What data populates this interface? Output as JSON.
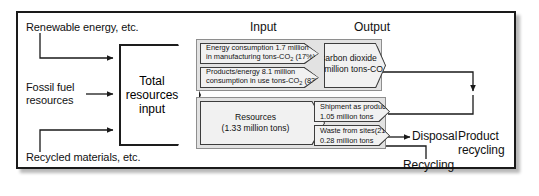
{
  "diagram": {
    "column_headers": {
      "input": "Input",
      "output": "Output"
    },
    "inputs_left": [
      {
        "id": "renewable-energy",
        "label": "Renewable energy, etc."
      },
      {
        "id": "fossil-fuel",
        "label": "Fossil fuel\nresources"
      },
      {
        "id": "recycled-materials",
        "label": "Recycled materials, etc."
      }
    ],
    "center": {
      "label": "Total\nresources\ninput"
    },
    "energy_row": {
      "input": [
        {
          "id": "energy-consumption",
          "line1": "Energy consumption 1.7 million",
          "line2_pre": "in manufacturing tons-CO",
          "line2_sub": "2",
          "line2_post": " (17%)"
        },
        {
          "id": "products-energy",
          "line1": "Products/energy 8.1 million",
          "line2_pre": "consumption in use tons-CO",
          "line2_sub": "2",
          "line2_post": " (83%)"
        }
      ],
      "output": {
        "id": "carbon-dioxide",
        "line1": "Carbon dioxide",
        "line2_pre": "(9.8 million tons-CO",
        "line2_sub": "2",
        "line2_post": ")"
      }
    },
    "materials_row": {
      "input": {
        "id": "resources",
        "line1": "Resources",
        "line2": "(1.33 million tons)"
      },
      "output": [
        {
          "id": "shipment-as-products",
          "line1": "Shipment as products  (79%)",
          "line2": "1.05 million tons"
        },
        {
          "id": "waste-from-sites",
          "line1": "Waste from sites",
          "line1_pct": "(21%)",
          "line2": "0.28 million tons"
        }
      ]
    },
    "outputs_right": [
      {
        "id": "disposal",
        "label": "Disposal"
      },
      {
        "id": "product-recycling",
        "label": "Product\nrecycling"
      },
      {
        "id": "recycling",
        "label": "Recycling"
      }
    ]
  }
}
